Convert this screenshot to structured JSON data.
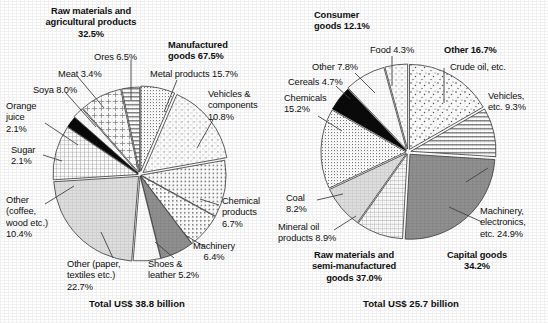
{
  "chart_data": [
    {
      "type": "pie",
      "title": "Exports",
      "total_label": "Total US$ 38.8 billion",
      "groups": [
        {
          "label": "Raw materials and agricultural products",
          "value": 32.5
        },
        {
          "label": "Manufactured goods",
          "value": 67.5
        }
      ],
      "categories": [
        "Ores",
        "Metal products",
        "Vehicles & components",
        "Chemical products",
        "Machinery",
        "Shoes & leather",
        "Other (paper, textiles etc.)",
        "Other (coffee, wood etc.)",
        "Sugar",
        "Orange juice",
        "Soya",
        "Meat"
      ],
      "values": [
        6.5,
        15.7,
        10.8,
        6.7,
        6.4,
        5.2,
        22.7,
        10.4,
        2.1,
        2.1,
        8.0,
        3.4
      ],
      "slices": [
        {
          "name": "Ores",
          "label": "Ores 6.5%",
          "value": 6.5,
          "pattern": "fine-dot-grid"
        },
        {
          "name": "Metal products",
          "label": "Metal products 15.7%",
          "value": 15.7,
          "pattern": "sparse-dot"
        },
        {
          "name": "Vehicles & components",
          "label": "Vehicles & components 10.8%",
          "value": 10.8,
          "pattern": "medium-dot"
        },
        {
          "name": "Chemical products",
          "label": "Chemical products 6.7%",
          "value": 6.7,
          "pattern": "square-dot"
        },
        {
          "name": "Machinery",
          "label": "Machinery 6.4%",
          "value": 6.4,
          "pattern": "solid-gray"
        },
        {
          "name": "Shoes & leather",
          "label": "Shoes & leather 5.2%",
          "value": 5.2,
          "pattern": "white"
        },
        {
          "name": "Other (paper, textiles etc.)",
          "label": "Other (paper, textiles etc.) 22.7%",
          "value": 22.7,
          "pattern": "light-gray"
        },
        {
          "name": "Other (coffee, wood etc.)",
          "label": "Other (coffee, wood etc.) 10.4%",
          "value": 10.4,
          "pattern": "crosshatch"
        },
        {
          "name": "Sugar",
          "label": "Sugar 2.1%",
          "value": 2.1,
          "pattern": "black"
        },
        {
          "name": "Orange juice",
          "label": "Orange juice 2.1%",
          "value": 2.1,
          "pattern": "white"
        },
        {
          "name": "Soya",
          "label": "Soya 8.0%",
          "value": 8.0,
          "pattern": "plus"
        },
        {
          "name": "Meat",
          "label": "Meat 3.4%",
          "value": 3.4,
          "pattern": "hlines"
        }
      ]
    },
    {
      "type": "pie",
      "title": "Imports",
      "total_label": "Total US$ 25.7 billion",
      "groups": [
        {
          "label": "Consumer goods",
          "value": 12.1
        },
        {
          "label": "Other",
          "value": 16.7
        },
        {
          "label": "Capital goods",
          "value": 34.2
        },
        {
          "label": "Raw materials and semi-manufactured goods",
          "value": 37.0
        }
      ],
      "categories": [
        "Crude oil, etc.",
        "Vehicles, etc.",
        "Machinery, electronics, etc.",
        "Mineral oil products",
        "Coal",
        "Chemicals",
        "Cereals",
        "Other",
        "Food"
      ],
      "values": [
        16.7,
        9.3,
        24.9,
        8.9,
        8.2,
        15.2,
        4.7,
        7.8,
        4.3
      ],
      "slices": [
        {
          "name": "Crude oil, etc.",
          "label": "Crude oil, etc.",
          "value": 16.7,
          "pattern": "speckle"
        },
        {
          "name": "Vehicles, etc.",
          "label": "Vehicles, etc. 9.3%",
          "value": 9.3,
          "pattern": "hlines"
        },
        {
          "name": "Machinery, electronics, etc.",
          "label": "Machinery, electronics, etc. 24.9%",
          "value": 24.9,
          "pattern": "solid-gray"
        },
        {
          "name": "Mineral oil products",
          "label": "Mineral oil products 8.9%",
          "value": 8.9,
          "pattern": "crosshatch"
        },
        {
          "name": "Coal",
          "label": "Coal 8.2%",
          "value": 8.2,
          "pattern": "light-gray"
        },
        {
          "name": "Chemicals",
          "label": "Chemicals 15.2%",
          "value": 15.2,
          "pattern": "fine-dot-grid"
        },
        {
          "name": "Cereals",
          "label": "Cereals 4.7%",
          "value": 4.7,
          "pattern": "black"
        },
        {
          "name": "Other",
          "label": "Other 7.8%",
          "value": 7.8,
          "pattern": "white"
        },
        {
          "name": "Food",
          "label": "Food 4.3%",
          "value": 4.3,
          "pattern": "sparse-dot"
        }
      ]
    }
  ],
  "left": {
    "group_raw": "Raw materials and\nagricultural products\n32.5%",
    "group_raw_l1": "Raw materials and",
    "group_raw_l2": "agricultural products",
    "group_raw_l3": "32.5%",
    "group_mfg_l1": "Manufactured",
    "group_mfg_l2": "goods 67.5%",
    "ores": "Ores 6.5%",
    "meat": "Meat 3.4%",
    "soya": "Soya 8.0%",
    "orange_l1": "Orange",
    "orange_l2": "juice",
    "orange_l3": "2.1%",
    "sugar_l1": "Sugar",
    "sugar_l2": "2.1%",
    "other_coffee_l1": "Other",
    "other_coffee_l2": "(coffee,",
    "other_coffee_l3": "wood etc.)",
    "other_coffee_l4": "10.4%",
    "other_paper_l1": "Other (paper,",
    "other_paper_l2": "textiles etc.)",
    "other_paper_l3": "22.7%",
    "shoes_l1": "Shoes &",
    "shoes_l2": "leather 5.2%",
    "machinery_l1": "Machinery",
    "machinery_l2": "6.4%",
    "chemical_l1": "Chemical",
    "chemical_l2": "products",
    "chemical_l3": "6.7%",
    "metal": "Metal products 15.7%",
    "vehicles_l1": "Vehicles &",
    "vehicles_l2": "components",
    "vehicles_l3": "10.8%",
    "total": "Total US$ 38.8 billion"
  },
  "right": {
    "group_consumer_l1": "Consumer",
    "group_consumer_l2": "goods 12.1%",
    "group_other": "Other 16.7%",
    "food": "Food 4.3%",
    "crude": "Crude oil, etc.",
    "other78": "Other 7.8%",
    "cereals": "Cereals 4.7%",
    "chemicals_l1": "Chemicals",
    "chemicals_l2": "15.2%",
    "vehicles_l1": "Vehicles,",
    "vehicles_l2": "etc. 9.3%",
    "machinery_l1": "Machinery,",
    "machinery_l2": "electronics,",
    "machinery_l3": "etc. 24.9%",
    "coal_l1": "Coal",
    "coal_l2": "8.2%",
    "mineral_l1": "Mineral oil",
    "mineral_l2": "products 8.9%",
    "group_rawsemi_l1": "Raw materials and",
    "group_rawsemi_l2": "semi-manufactured",
    "group_rawsemi_l3": "goods 37.0%",
    "group_capital_l1": "Capital goods",
    "group_capital_l2": "34.2%",
    "total": "Total US$ 25.7 billion"
  }
}
